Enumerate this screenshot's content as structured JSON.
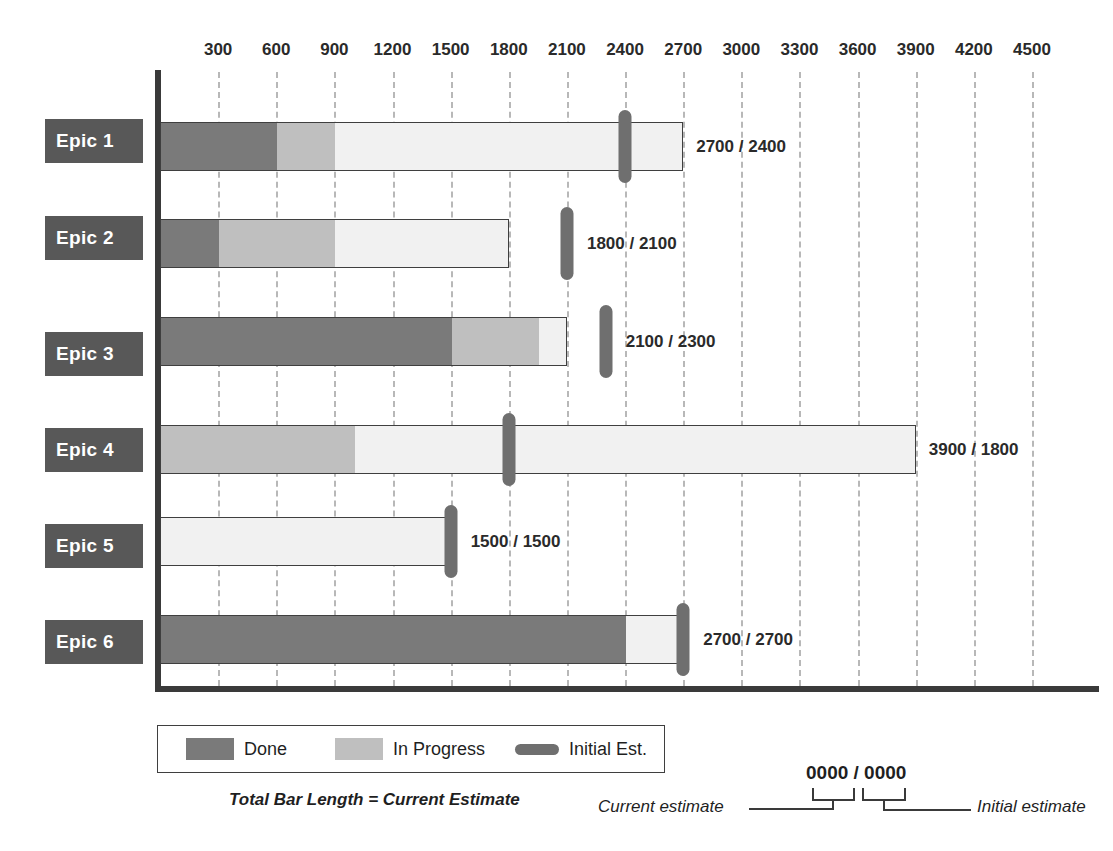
{
  "chart_data": {
    "type": "bar",
    "title": "",
    "xlabel": "",
    "ylabel": "",
    "orientation": "horizontal",
    "stacked": true,
    "grid": true,
    "xlim": [
      0,
      4500
    ],
    "xticks": [
      300,
      600,
      900,
      1200,
      1500,
      1800,
      2100,
      2400,
      2700,
      3000,
      3300,
      3600,
      3900,
      4200,
      4500
    ],
    "xtick_labels": [
      "300",
      "600",
      "900",
      "1200",
      "1500",
      "1800",
      "2100",
      "2400",
      "2700",
      "3000",
      "3300",
      "3600",
      "3900",
      "4200",
      "4500"
    ],
    "categories": [
      "Epic 1",
      "Epic 2",
      "Epic 3",
      "Epic 4",
      "Epic 5",
      "Epic 6"
    ],
    "series": [
      {
        "name": "Done",
        "values": [
          600,
          300,
          1500,
          0,
          0,
          2400
        ]
      },
      {
        "name": "In Progress",
        "values": [
          300,
          600,
          450,
          1000,
          0,
          0
        ]
      },
      {
        "name": "Remaining",
        "values": [
          1800,
          900,
          150,
          2900,
          1500,
          300
        ]
      }
    ],
    "marker_series": {
      "name": "Initial Est.",
      "values": [
        2400,
        2100,
        2300,
        1800,
        1500,
        2700
      ]
    },
    "current_estimate": [
      2700,
      1800,
      2100,
      3900,
      1500,
      2700
    ],
    "data_labels": [
      "2700 / 2400",
      "1800 / 2100",
      "2100 / 2300",
      "3900 / 1800",
      "1500 / 1500",
      "2700 / 2700"
    ],
    "colors": {
      "done": "#7a7a7a",
      "in_progress": "#bfbfbf",
      "remaining": "#f1f1f1",
      "marker": "#6f6f6f",
      "chip": "#585858",
      "axis": "#3a3a3a",
      "grid": "#b8b8b8"
    },
    "legend": {
      "position": "bottom-left",
      "entries": [
        "Done",
        "In Progress",
        "Initial Est."
      ]
    }
  },
  "rows": [
    {
      "label": "Epic 1",
      "value_label": "2700 / 2400"
    },
    {
      "label": "Epic 2",
      "value_label": "1800 / 2100"
    },
    {
      "label": "Epic 3",
      "value_label": "2100 / 2300"
    },
    {
      "label": "Epic 4",
      "value_label": "3900 / 1800"
    },
    {
      "label": "Epic 5",
      "value_label": "1500 / 1500"
    },
    {
      "label": "Epic 6",
      "value_label": "2700 / 2700"
    }
  ],
  "legend": {
    "done_label": "Done",
    "in_progress_label": "In Progress",
    "initial_est_label": "Initial Est."
  },
  "footnotes": {
    "total_bar": "Total Bar Length = Current Estimate",
    "sample_value": "0000 / 0000",
    "current_estimate_caption": "Current estimate",
    "initial_estimate_caption": "Initial estimate"
  }
}
